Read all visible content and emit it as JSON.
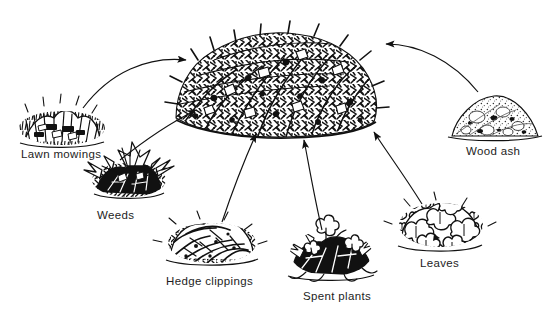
{
  "diagram": {
    "type": "illustration-diagram",
    "background_color": "#ffffff",
    "ink_color": "#111111",
    "center": {
      "name": "compost-heap",
      "label": "",
      "description": "large mounded compost heap of mixed garden waste"
    },
    "items": [
      {
        "id": "lawn-mowings",
        "label": "Lawn mowings",
        "icon": "grass-clippings-icon",
        "position": "left",
        "arrow": "curves up and right into the heap"
      },
      {
        "id": "weeds",
        "label": "Weeds",
        "icon": "weed-clump-icon",
        "position": "lower-left",
        "arrow": "curves up and right into the heap"
      },
      {
        "id": "hedge-clippings",
        "label": "Hedge clippings",
        "icon": "twig-tangle-icon",
        "position": "bottom-left",
        "arrow": "curves up and right into the heap"
      },
      {
        "id": "spent-plants",
        "label": "Spent plants",
        "icon": "uprooted-plants-icon",
        "position": "bottom-center",
        "arrow": "curves up into the heap"
      },
      {
        "id": "leaves",
        "label": "Leaves",
        "icon": "leaf-pile-icon",
        "position": "lower-right",
        "arrow": "curves up and left into the heap"
      },
      {
        "id": "wood-ash",
        "label": "Wood ash",
        "icon": "ash-mound-icon",
        "position": "right",
        "arrow": "curves up and left into the heap"
      }
    ]
  }
}
